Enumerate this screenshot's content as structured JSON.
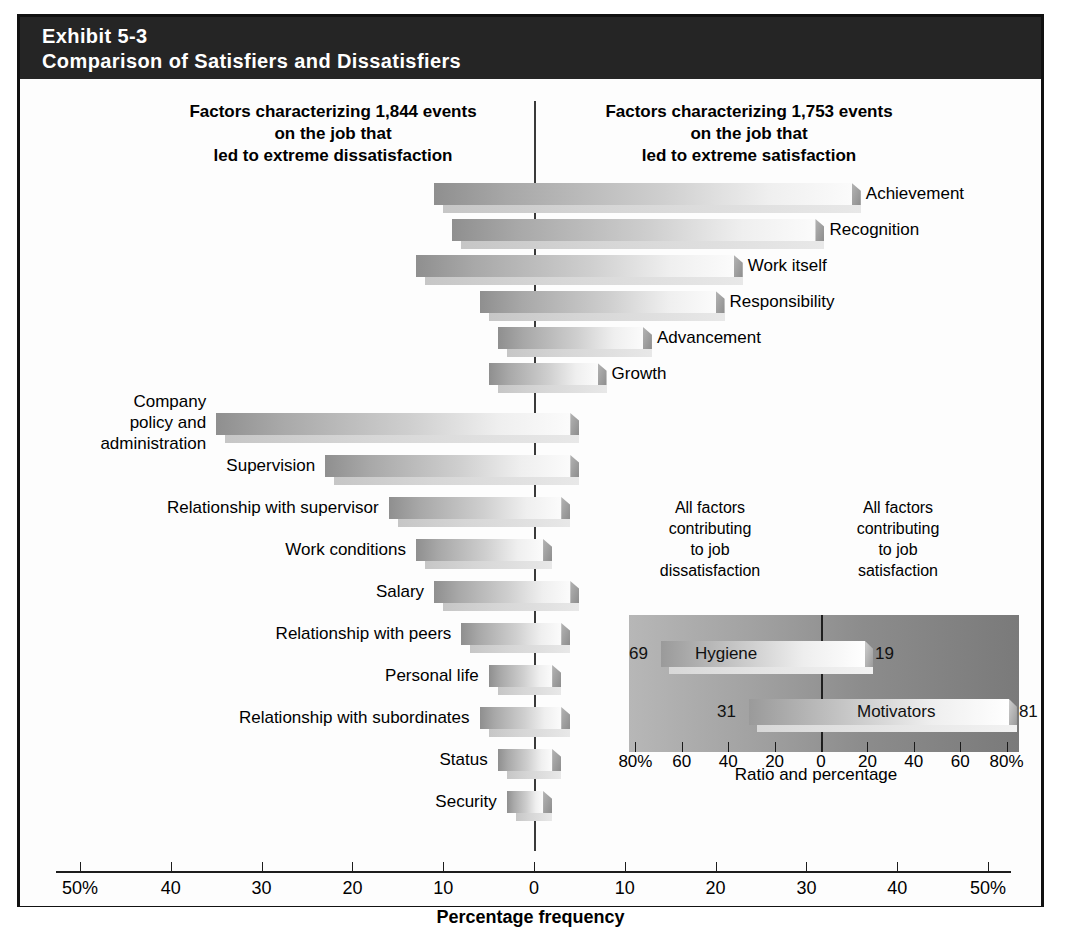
{
  "exhibit": {
    "number": "Exhibit 5-3",
    "title": "Comparison of Satisfiers and Dissatisfiers"
  },
  "columns": {
    "left_heading": "Factors characterizing 1,844 events\non the job that\nled to extreme dissatisfaction",
    "right_heading": "Factors characterizing 1,753 events\non the job that\nled to extreme satisfaction"
  },
  "axis": {
    "title": "Percentage frequency",
    "tick_labels": [
      "50%",
      "40",
      "30",
      "20",
      "10",
      "0",
      "10",
      "20",
      "30",
      "40",
      "50%"
    ],
    "tick_values": [
      -50,
      -40,
      -30,
      -20,
      -10,
      0,
      10,
      20,
      30,
      40,
      50
    ],
    "zero_value": 0
  },
  "inset": {
    "left_heading": "All factors\ncontributing\nto job\ndissatisfaction",
    "right_heading": "All factors\ncontributing\nto job\nsatisfaction",
    "axis_title": "Ratio and percentage",
    "tick_labels": [
      "80%",
      "60",
      "40",
      "20",
      "0",
      "20",
      "40",
      "60",
      "80%"
    ],
    "tick_values": [
      -80,
      -60,
      -40,
      -20,
      0,
      20,
      40,
      60,
      80
    ],
    "rows": [
      {
        "label": "Hygiene",
        "left_value": 69,
        "right_value": 19,
        "left_text": "69",
        "right_text": "19"
      },
      {
        "label": "Motivators",
        "left_value": 31,
        "right_value": 81,
        "left_text": "31",
        "right_text": "81"
      }
    ]
  },
  "chart_data": {
    "type": "bar",
    "orientation": "horizontal",
    "title": "Comparison of Satisfiers and Dissatisfiers",
    "subtitle": "Exhibit 5-3",
    "xlabel": "Percentage frequency",
    "ylabel": "",
    "xlim": [
      -50,
      50
    ],
    "grid": false,
    "legend": "none",
    "note": "Each bar spans from a negative (dissatisfaction) percentage to a positive (satisfaction) percentage about the zero line.",
    "categories": [
      "Achievement",
      "Recognition",
      "Work itself",
      "Responsibility",
      "Advancement",
      "Growth",
      "Company policy and administration",
      "Supervision",
      "Relationship with supervisor",
      "Work conditions",
      "Salary",
      "Relationship with peers",
      "Personal life",
      "Relationship with subordinates",
      "Status",
      "Security"
    ],
    "series": [
      {
        "name": "Dissatisfaction side (percentage to the left of zero)",
        "values": [
          11,
          9,
          13,
          6,
          4,
          5,
          31,
          20,
          15,
          11,
          8,
          8,
          5,
          6,
          4,
          3
        ]
      },
      {
        "name": "Satisfaction side (percentage to the right of zero)",
        "values": [
          41,
          33,
          26,
          23,
          20,
          16,
          4,
          3,
          3,
          1,
          4,
          3,
          2,
          3,
          2,
          1
        ]
      }
    ]
  },
  "bars": [
    {
      "label": "Achievement",
      "start": -11,
      "end": 35,
      "group": "motivator",
      "label_side": "right",
      "multiline": false
    },
    {
      "label": "Recognition",
      "start": -9,
      "end": 31,
      "group": "motivator",
      "label_side": "right",
      "multiline": false
    },
    {
      "label": "Work itself",
      "start": -13,
      "end": 22,
      "group": "motivator",
      "label_side": "right",
      "multiline": false
    },
    {
      "label": "Responsibility",
      "start": -6,
      "end": 20,
      "group": "motivator",
      "label_side": "right",
      "multiline": false
    },
    {
      "label": "Advancement",
      "start": -4,
      "end": 12,
      "group": "motivator",
      "label_side": "right",
      "multiline": false
    },
    {
      "label": "Growth",
      "start": -5,
      "end": 7,
      "group": "motivator",
      "label_side": "right",
      "multiline": false
    },
    {
      "label": "Company\npolicy and\nadministration",
      "start": -35,
      "end": 4,
      "group": "hygiene",
      "label_side": "left",
      "multiline": true
    },
    {
      "label": "Supervision",
      "start": -23,
      "end": 4,
      "group": "hygiene",
      "label_side": "left",
      "multiline": false
    },
    {
      "label": "Relationship with supervisor",
      "start": -16,
      "end": 3,
      "group": "hygiene",
      "label_side": "left",
      "multiline": false
    },
    {
      "label": "Work conditions",
      "start": -13,
      "end": 1,
      "group": "hygiene",
      "label_side": "left",
      "multiline": false
    },
    {
      "label": "Salary",
      "start": -11,
      "end": 4,
      "group": "hygiene",
      "label_side": "left",
      "multiline": false
    },
    {
      "label": "Relationship with peers",
      "start": -8,
      "end": 3,
      "group": "hygiene",
      "label_side": "left",
      "multiline": false
    },
    {
      "label": "Personal life",
      "start": -5,
      "end": 2,
      "group": "hygiene",
      "label_side": "left",
      "multiline": false
    },
    {
      "label": "Relationship with subordinates",
      "start": -6,
      "end": 3,
      "group": "hygiene",
      "label_side": "left",
      "multiline": false
    },
    {
      "label": "Status",
      "start": -4,
      "end": 2,
      "group": "hygiene",
      "label_side": "left",
      "multiline": false
    },
    {
      "label": "Security",
      "start": -3,
      "end": 1,
      "group": "hygiene",
      "label_side": "left",
      "multiline": false
    }
  ],
  "colors": {
    "header_band": "#252525",
    "frame_border": "#111111",
    "page_background": "#fdfdfd",
    "bar_dark": "#8f8f8f",
    "bar_light": "#fbfbfb",
    "inset_panel": "#8c8c8c",
    "axis_line": "#1d1d1d"
  }
}
